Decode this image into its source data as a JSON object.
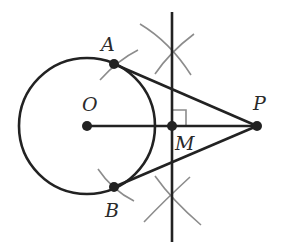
{
  "figure": {
    "labels": {
      "A": "A",
      "B": "B",
      "O": "O",
      "M": "M",
      "P": "P"
    },
    "colors": {
      "line": "#222222",
      "arc": "#8c8c8c",
      "background": "#ffffff"
    }
  }
}
